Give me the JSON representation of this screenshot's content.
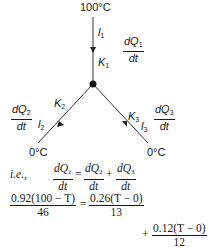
{
  "diagram": {
    "top_temp": "100°C",
    "left_temp": "0°C",
    "right_temp": "0°C",
    "rod1": {
      "length_label": "l",
      "length_sub": "1",
      "k_label": "K",
      "k_sub": "1",
      "flow_num": "dQ",
      "flow_sub": "1",
      "flow_den": "dt"
    },
    "rod2": {
      "length_label": "l",
      "length_sub": "2",
      "k_label": "K",
      "k_sub": "2",
      "flow_num": "dQ",
      "flow_sub": "2",
      "flow_den": "dt"
    },
    "rod3": {
      "length_label": "l",
      "length_sub": "3",
      "k_label": "K",
      "k_sub": "3",
      "flow_num": "dQ",
      "flow_sub": "3",
      "flow_den": "dt"
    }
  },
  "equations": {
    "ie_label": "i.e.,",
    "eq1": {
      "lhs_num": "dQ",
      "lhs_sub": "1",
      "lhs_den": "dt",
      "equals": "=",
      "t2_num": "dQ",
      "t2_sub": "2",
      "t2_den": "dt",
      "plus": "+",
      "t3_num": "dQ",
      "t3_sub": "3",
      "t3_den": "dt"
    },
    "eq2": {
      "lhs_num": "0.92(100 − T)",
      "lhs_den": "46",
      "equals": "=",
      "rhs_num": "0.26(T − 0)",
      "rhs_den": "13"
    },
    "eq3": {
      "plus": "+",
      "num": "0.12(T − 0)",
      "den": "12"
    }
  },
  "colors": {
    "ink": "#1a1a1a",
    "background": "#ffffff"
  }
}
